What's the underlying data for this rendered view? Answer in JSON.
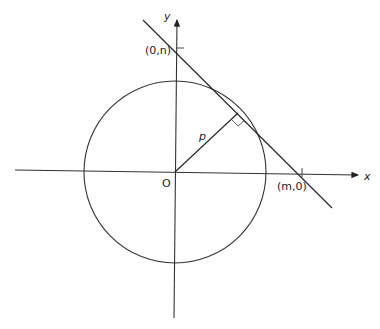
{
  "diagram": {
    "labels": {
      "y_axis": "y",
      "x_axis": "x",
      "origin": "O",
      "perpendicular": "p",
      "y_intercept": "(0,n)",
      "x_intercept": "(m,0)"
    },
    "colors": {
      "stroke": "#222222",
      "background": "#ffffff"
    }
  }
}
